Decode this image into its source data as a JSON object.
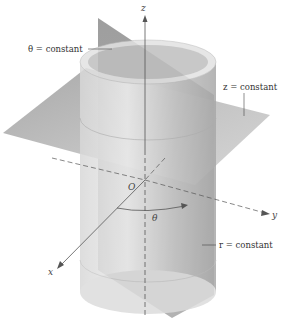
{
  "diagram": {
    "type": "cylindrical-coordinates-surfaces",
    "axes": {
      "x_label": "x",
      "y_label": "y",
      "z_label": "z",
      "origin_label": "O",
      "angle_label": "θ"
    },
    "surfaces": {
      "theta_const": "θ = constant",
      "z_const": "z = constant",
      "r_const": "r = constant"
    },
    "colors": {
      "plane_dark": "#8a8a8a",
      "plane_light": "#b5b5b5",
      "cylinder": "#d0d0d0",
      "axis": "#555555"
    }
  }
}
